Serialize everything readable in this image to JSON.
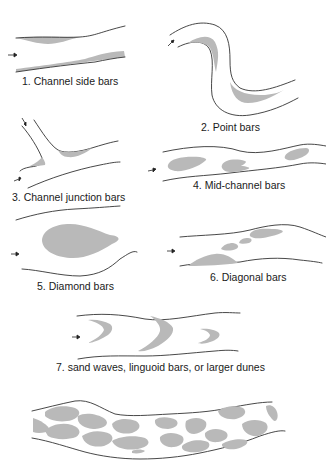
{
  "figure": {
    "bar_color": "#b9b9b9",
    "bank_color": "#333333",
    "panels": [
      {
        "id": 1,
        "label": "1. Channel side bars"
      },
      {
        "id": 2,
        "label": "2. Point bars"
      },
      {
        "id": 3,
        "label": "3. Channel junction bars"
      },
      {
        "id": 4,
        "label": "4. Mid-channel bars"
      },
      {
        "id": 5,
        "label": "5. Diamond bars"
      },
      {
        "id": 6,
        "label": "6. Diagonal bars"
      },
      {
        "id": 7,
        "label": "7. sand waves, linguoid bars, or larger dunes"
      },
      {
        "id": 8,
        "label": ""
      }
    ],
    "flow_arrow_icon": "right-arrow"
  }
}
